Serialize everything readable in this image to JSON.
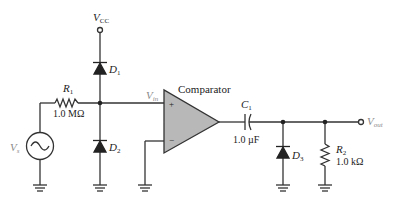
{
  "diagram": {
    "labels": {
      "vcc": {
        "main": "V",
        "sub": "CC"
      },
      "d1": {
        "main": "D",
        "sub": "1"
      },
      "d2": {
        "main": "D",
        "sub": "2"
      },
      "d3": {
        "main": "D",
        "sub": "3"
      },
      "r1": {
        "main": "R",
        "sub": "1",
        "value": "1.0 MΩ"
      },
      "r2": {
        "main": "R",
        "sub": "2",
        "value": "1.0 kΩ"
      },
      "c1": {
        "main": "C",
        "sub": "1",
        "value": "1.0 µF"
      },
      "vs": {
        "main": "V",
        "sub": "s"
      },
      "vin": {
        "main": "V",
        "sub": "in"
      },
      "vout": {
        "main": "V",
        "sub": "out"
      },
      "comparator": "Comparator",
      "plus": "+",
      "minus": "−"
    },
    "colors": {
      "wire": "#333333",
      "opamp_fill": "#b8b8b8",
      "label_gray": "#8a8a8a"
    }
  }
}
